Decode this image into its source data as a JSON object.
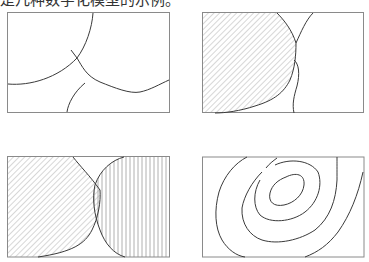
{
  "caption": "是几种数字化模型的示例。",
  "colors": {
    "line": "#3a3a3a",
    "frame": "#8a8a8a",
    "hatch": "#9a9a9a"
  },
  "panels": [
    {
      "id": "panel-1",
      "label": "line-model",
      "description": "Intersecting boundary lines"
    },
    {
      "id": "panel-2",
      "label": "single-hatched-region",
      "description": "Hatched region with boundary lines"
    },
    {
      "id": "panel-3",
      "label": "two-hatched-regions",
      "description": "Diagonal and vertical hatched overlapping regions"
    },
    {
      "id": "panel-4",
      "label": "contour-model",
      "description": "Nested contour lines"
    }
  ]
}
